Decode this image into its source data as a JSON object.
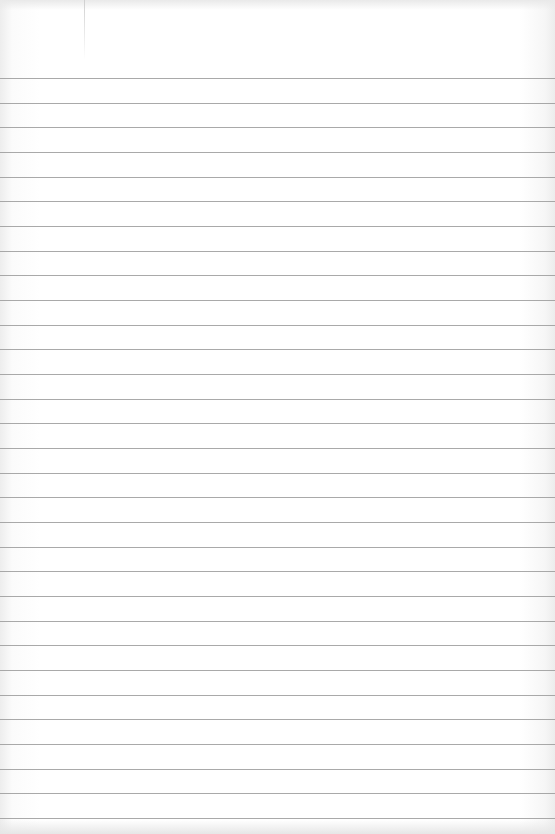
{
  "image": {
    "description": "Blank sheet of lined notebook paper",
    "background_color": "#ffffff",
    "rule_color": "#9a9a9a",
    "margin_line_color": "#d0d0d0"
  },
  "paper": {
    "rule_count": 31,
    "first_rule_y": 78,
    "rule_spacing_px": 24.67,
    "margin_line_x": 84,
    "text_content": ""
  }
}
